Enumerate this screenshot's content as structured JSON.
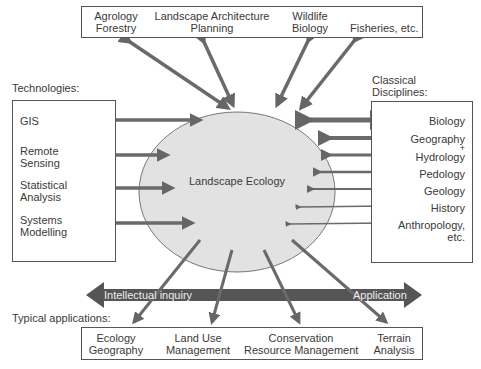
{
  "center": {
    "label": "Landscape Ecology"
  },
  "top_box": {
    "items": [
      {
        "line1": "Agrology",
        "line2": "Forestry"
      },
      {
        "line1": "Landscape Architecture",
        "line2": "Planning"
      },
      {
        "line1": "Wildlife",
        "line2": "Biology"
      },
      {
        "line1": "",
        "line2": "Fisheries, etc."
      }
    ]
  },
  "left_box": {
    "title": "Technologies:",
    "items": [
      {
        "line1": "GIS",
        "line2": ""
      },
      {
        "line1": "Remote",
        "line2": "Sensing"
      },
      {
        "line1": "Statistical",
        "line2": "Analysis"
      },
      {
        "line1": "Systems",
        "line2": "Modelling"
      }
    ]
  },
  "right_box": {
    "title_line1": "Classical",
    "title_line2": "Disciplines:",
    "items": [
      "Biology",
      "Geography",
      "+",
      "Hydrology",
      "Pedology",
      "Geology",
      "History",
      "Anthropology,",
      "etc."
    ]
  },
  "spectrum": {
    "left_label": "Intellectual inquiry",
    "right_label": "Application"
  },
  "bottom_box": {
    "title": "Typical applications:",
    "items": [
      {
        "line1": "Ecology",
        "line2": "Geography"
      },
      {
        "line1": "Land Use",
        "line2": "Management"
      },
      {
        "line1": "Conservation",
        "line2": "Resource Management"
      },
      {
        "line1": "Terrain",
        "line2": "Analysis"
      }
    ]
  },
  "colors": {
    "arrow": "#6a6a6a",
    "ellipse_fill": "#e2e2e2",
    "band": "#555555"
  }
}
